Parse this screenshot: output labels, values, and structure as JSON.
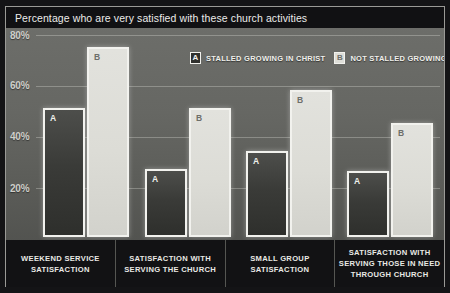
{
  "title": "Percentage who are very satisfied with these church activities",
  "legend": [
    {
      "key": "A",
      "label": "STALLED GROWING IN CHRIST"
    },
    {
      "key": "B",
      "label": "NOT STALLED GROWING IN CHRIST"
    }
  ],
  "axis": {
    "ticks": [
      "80%",
      "60%",
      "40%",
      "20%"
    ]
  },
  "chart_data": {
    "type": "bar",
    "title": "Percentage who are very satisfied with these church activities",
    "xlabel": "",
    "ylabel": "",
    "ylim": [
      0,
      85
    ],
    "grid": true,
    "legend_position": "top-center",
    "categories": [
      "WEEKEND SERVICE SATISFACTION",
      "SATISFACTION WITH SERVING THE CHURCH",
      "SMALL GROUP SATISFACTION",
      "SATISFACTION WITH SERVING THOSE IN NEED THROUGH CHURCH"
    ],
    "ytick_labels": [
      "20%",
      "40%",
      "60%",
      "80%"
    ],
    "ytick_values": [
      20,
      40,
      60,
      80
    ],
    "series": [
      {
        "name": "STALLED GROWING IN CHRIST",
        "key": "A",
        "values": [
          51,
          27,
          34,
          26
        ]
      },
      {
        "name": "NOT STALLED GROWING IN CHRIST",
        "key": "B",
        "values": [
          75,
          51,
          58,
          45
        ]
      }
    ],
    "colors": {
      "series_a": "#32332f",
      "series_b": "#deded8",
      "background": "#5f605c",
      "title_bar": "#111113",
      "text": "#ececea"
    }
  }
}
